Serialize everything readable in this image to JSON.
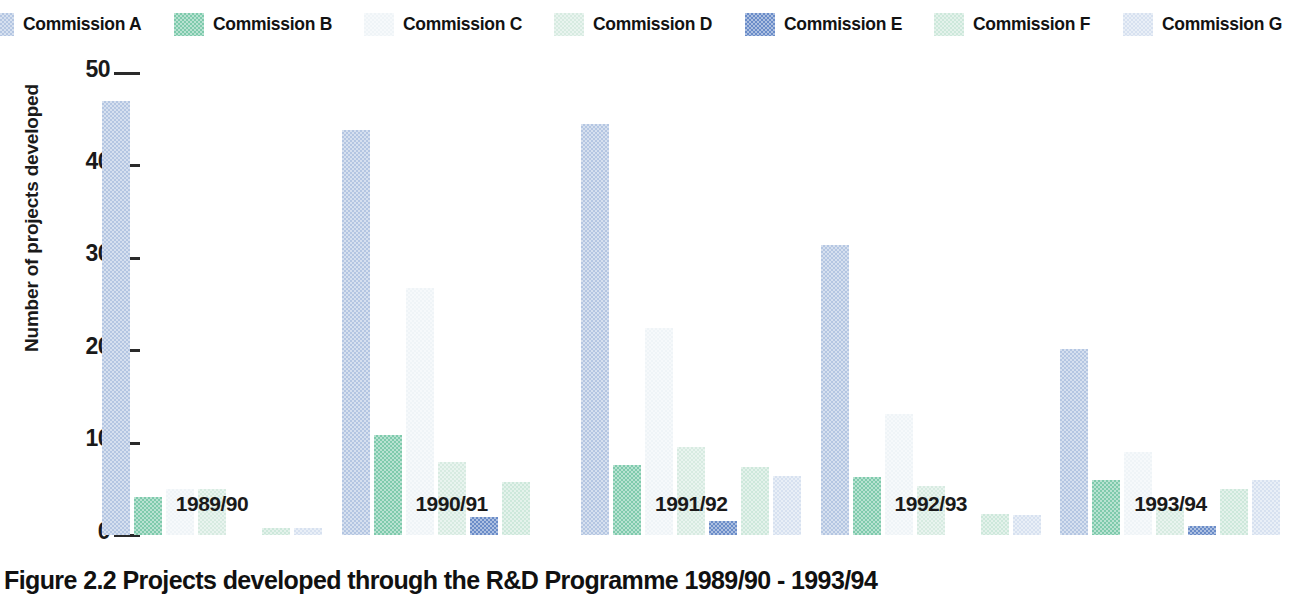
{
  "caption": "Figure 2.2 Projects developed through the R&D Programme 1989/90 - 1993/94",
  "legend": {
    "items": [
      {
        "label": "Commission A",
        "color": "#b4c6e2"
      },
      {
        "label": "Commission B",
        "color": "#7ecaac"
      },
      {
        "label": "Commission C",
        "color": "#eff4f7"
      },
      {
        "label": "Commission D",
        "color": "#d7ebe1"
      },
      {
        "label": "Commission E",
        "color": "#6a8cc8"
      },
      {
        "label": "Commission F",
        "color": "#cde8db"
      },
      {
        "label": "Commission G",
        "color": "#d7e1f0"
      }
    ]
  },
  "chart_data": {
    "type": "bar",
    "title": "Figure 2.2 Projects developed through the R&D Programme 1989/90 - 1993/94",
    "xlabel": "",
    "ylabel": "Number of projects developed",
    "ylim": [
      0,
      50
    ],
    "yticks": [
      0,
      10,
      20,
      30,
      40,
      50
    ],
    "grid": false,
    "legend_position": "top",
    "categories": [
      "1989/90",
      "1990/91",
      "1991/92",
      "1992/93",
      "1993/94"
    ],
    "series": [
      {
        "name": "Commission A",
        "color": "#b4c6e2",
        "values": [
          47,
          43.8,
          44.5,
          31.4,
          20.1
        ]
      },
      {
        "name": "Commission B",
        "color": "#7ecaac",
        "values": [
          4.1,
          10.8,
          7.6,
          6.3,
          6.0
        ]
      },
      {
        "name": "Commission C",
        "color": "#eff4f7",
        "values": [
          5.0,
          26.7,
          22.4,
          13.1,
          9.0
        ]
      },
      {
        "name": "Commission D",
        "color": "#d7ebe1",
        "values": [
          5.0,
          7.9,
          9.5,
          5.3,
          3.0
        ]
      },
      {
        "name": "Commission E",
        "color": "#6a8cc8",
        "values": [
          0,
          1.9,
          1.5,
          0,
          1.0
        ]
      },
      {
        "name": "Commission F",
        "color": "#cde8db",
        "values": [
          0.8,
          5.7,
          7.4,
          2.3,
          5.0
        ]
      },
      {
        "name": "Commission G",
        "color": "#d7e1f0",
        "values": [
          0.8,
          0,
          6.4,
          2.2,
          5.9
        ]
      }
    ]
  }
}
